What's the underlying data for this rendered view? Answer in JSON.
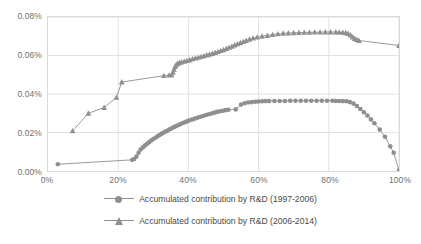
{
  "chart_data": {
    "type": "line",
    "title": "",
    "xlabel": "",
    "ylabel": "",
    "xlim": [
      0,
      100
    ],
    "ylim": [
      0,
      0.08
    ],
    "grid": true,
    "x_ticks": [
      "0%",
      "20%",
      "40%",
      "60%",
      "80%",
      "100%"
    ],
    "x_tick_values": [
      0,
      20,
      40,
      60,
      80,
      100
    ],
    "y_ticks": [
      "0.00%",
      "0.02%",
      "0.04%",
      "0.06%",
      "0.08%"
    ],
    "y_tick_values": [
      0,
      0.02,
      0.04,
      0.06,
      0.08
    ],
    "legend_position": "bottom",
    "series": [
      {
        "name": "Accumulated contribution by R&D (1997-2006)",
        "marker": "circle",
        "color": "#8f8f8f",
        "points": [
          [
            2.8,
            0.0035
          ],
          [
            24.0,
            0.0058
          ],
          [
            24.6,
            0.0062
          ],
          [
            25.2,
            0.0075
          ],
          [
            25.8,
            0.0095
          ],
          [
            26.4,
            0.0112
          ],
          [
            27.0,
            0.0122
          ],
          [
            27.6,
            0.0132
          ],
          [
            28.2,
            0.0141
          ],
          [
            28.8,
            0.015
          ],
          [
            29.4,
            0.0158
          ],
          [
            30.0,
            0.0166
          ],
          [
            30.6,
            0.0173
          ],
          [
            31.2,
            0.018
          ],
          [
            31.8,
            0.0187
          ],
          [
            32.4,
            0.0194
          ],
          [
            33.0,
            0.02
          ],
          [
            33.6,
            0.0206
          ],
          [
            34.2,
            0.0212
          ],
          [
            34.8,
            0.0218
          ],
          [
            35.4,
            0.0223
          ],
          [
            36.0,
            0.0229
          ],
          [
            36.6,
            0.0234
          ],
          [
            37.2,
            0.0239
          ],
          [
            37.8,
            0.0244
          ],
          [
            38.4,
            0.0249
          ],
          [
            39.0,
            0.0253
          ],
          [
            39.6,
            0.0258
          ],
          [
            40.2,
            0.0262
          ],
          [
            41.0,
            0.0267
          ],
          [
            41.8,
            0.0272
          ],
          [
            42.6,
            0.0277
          ],
          [
            43.4,
            0.0282
          ],
          [
            44.2,
            0.0286
          ],
          [
            45.0,
            0.0291
          ],
          [
            45.8,
            0.0295
          ],
          [
            46.6,
            0.0299
          ],
          [
            47.4,
            0.0303
          ],
          [
            48.2,
            0.0307
          ],
          [
            49.0,
            0.031
          ],
          [
            49.8,
            0.0313
          ],
          [
            50.6,
            0.0316
          ],
          [
            51.4,
            0.0318
          ],
          [
            53.5,
            0.032
          ],
          [
            55.0,
            0.0345
          ],
          [
            56.0,
            0.0352
          ],
          [
            57.0,
            0.0356
          ],
          [
            58.0,
            0.0358
          ],
          [
            59.0,
            0.036
          ],
          [
            60.0,
            0.0361
          ],
          [
            61.0,
            0.0362
          ],
          [
            62.0,
            0.0363
          ],
          [
            63.0,
            0.0363
          ],
          [
            64.5,
            0.0364
          ],
          [
            66.0,
            0.0364
          ],
          [
            67.5,
            0.0364
          ],
          [
            69.0,
            0.0365
          ],
          [
            70.5,
            0.0365
          ],
          [
            72.0,
            0.0365
          ],
          [
            73.5,
            0.0365
          ],
          [
            75.0,
            0.0365
          ],
          [
            76.5,
            0.0365
          ],
          [
            78.0,
            0.0365
          ],
          [
            79.5,
            0.0365
          ],
          [
            81.0,
            0.0365
          ],
          [
            82.0,
            0.0364
          ],
          [
            83.0,
            0.0364
          ],
          [
            84.0,
            0.0363
          ],
          [
            85.0,
            0.0362
          ],
          [
            86.0,
            0.0358
          ],
          [
            87.0,
            0.035
          ],
          [
            88.0,
            0.0338
          ],
          [
            89.0,
            0.0322
          ],
          [
            90.0,
            0.0305
          ],
          [
            91.0,
            0.0288
          ],
          [
            92.0,
            0.0268
          ],
          [
            93.0,
            0.0248
          ],
          [
            94.5,
            0.0215
          ],
          [
            96.0,
            0.0178
          ],
          [
            97.5,
            0.0128
          ],
          [
            98.5,
            0.0095
          ],
          [
            100.0,
            0.0002
          ]
        ]
      },
      {
        "name": "Accumulated contribution by R&D (2006-2014)",
        "marker": "triangle",
        "color": "#8f8f8f",
        "points": [
          [
            7.0,
            0.0208
          ],
          [
            11.5,
            0.03
          ],
          [
            16.0,
            0.033
          ],
          [
            19.5,
            0.0382
          ],
          [
            21.0,
            0.0462
          ],
          [
            33.0,
            0.0495
          ],
          [
            34.5,
            0.0498
          ],
          [
            35.2,
            0.05
          ],
          [
            35.6,
            0.0512
          ],
          [
            35.9,
            0.0528
          ],
          [
            36.2,
            0.0542
          ],
          [
            36.5,
            0.0552
          ],
          [
            36.9,
            0.0558
          ],
          [
            37.4,
            0.0562
          ],
          [
            38.0,
            0.0566
          ],
          [
            38.8,
            0.057
          ],
          [
            39.6,
            0.0574
          ],
          [
            40.4,
            0.0578
          ],
          [
            41.2,
            0.0582
          ],
          [
            42.0,
            0.0586
          ],
          [
            42.8,
            0.059
          ],
          [
            43.6,
            0.0594
          ],
          [
            44.4,
            0.0598
          ],
          [
            45.2,
            0.0602
          ],
          [
            46.0,
            0.0606
          ],
          [
            46.8,
            0.061
          ],
          [
            47.6,
            0.0615
          ],
          [
            48.4,
            0.062
          ],
          [
            49.2,
            0.0625
          ],
          [
            50.0,
            0.063
          ],
          [
            50.8,
            0.0636
          ],
          [
            51.6,
            0.0642
          ],
          [
            52.4,
            0.0648
          ],
          [
            53.2,
            0.0654
          ],
          [
            54.0,
            0.066
          ],
          [
            54.8,
            0.0666
          ],
          [
            55.6,
            0.0672
          ],
          [
            56.4,
            0.0678
          ],
          [
            57.4,
            0.0684
          ],
          [
            58.4,
            0.069
          ],
          [
            59.6,
            0.0695
          ],
          [
            61.0,
            0.07
          ],
          [
            62.5,
            0.0704
          ],
          [
            64.0,
            0.0708
          ],
          [
            65.5,
            0.0712
          ],
          [
            67.0,
            0.0715
          ],
          [
            68.5,
            0.0717
          ],
          [
            70.0,
            0.0718
          ],
          [
            71.5,
            0.0719
          ],
          [
            73.0,
            0.072
          ],
          [
            74.5,
            0.072
          ],
          [
            76.0,
            0.0721
          ],
          [
            77.5,
            0.0721
          ],
          [
            79.0,
            0.0722
          ],
          [
            80.5,
            0.0722
          ],
          [
            82.0,
            0.0722
          ],
          [
            83.0,
            0.0721
          ],
          [
            84.0,
            0.072
          ],
          [
            84.8,
            0.0718
          ],
          [
            85.5,
            0.0714
          ],
          [
            86.2,
            0.0706
          ],
          [
            86.8,
            0.0696
          ],
          [
            87.4,
            0.0688
          ],
          [
            88.0,
            0.0682
          ],
          [
            88.6,
            0.0678
          ],
          [
            100.0,
            0.0652
          ]
        ]
      }
    ]
  }
}
